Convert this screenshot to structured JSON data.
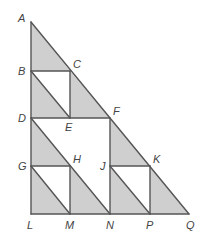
{
  "diagram": {
    "colors": {
      "shade": "#cfcfcf",
      "line": "#555555",
      "label": "#444444",
      "background": "#ffffff"
    },
    "points": {
      "A": [
        31,
        22
      ],
      "B": [
        31,
        71
      ],
      "C": [
        70,
        71
      ],
      "D": [
        31,
        118
      ],
      "E": [
        70,
        118
      ],
      "F": [
        110,
        118
      ],
      "G": [
        31,
        166
      ],
      "H": [
        70,
        166
      ],
      "J": [
        110,
        166
      ],
      "K": [
        150,
        166
      ],
      "L": [
        31,
        214
      ],
      "M": [
        70,
        214
      ],
      "N": [
        110,
        214
      ],
      "P": [
        150,
        214
      ],
      "Q": [
        189,
        214
      ]
    },
    "shaded_triangles": [
      [
        "A",
        "B",
        "C"
      ],
      [
        "B",
        "D",
        "E"
      ],
      [
        "C",
        "E",
        "F"
      ],
      [
        "D",
        "G",
        "H"
      ],
      [
        "G",
        "L",
        "M"
      ],
      [
        "H",
        "M",
        "N"
      ],
      [
        "F",
        "J",
        "K"
      ],
      [
        "J",
        "N",
        "P"
      ],
      [
        "K",
        "P",
        "Q"
      ]
    ],
    "segments": [
      [
        "A",
        "L"
      ],
      [
        "L",
        "Q"
      ],
      [
        "A",
        "Q"
      ],
      [
        "B",
        "C"
      ],
      [
        "C",
        "E"
      ],
      [
        "B",
        "E"
      ],
      [
        "D",
        "F"
      ],
      [
        "D",
        "N"
      ],
      [
        "G",
        "H"
      ],
      [
        "H",
        "M"
      ],
      [
        "G",
        "M"
      ],
      [
        "F",
        "N"
      ],
      [
        "J",
        "K"
      ],
      [
        "K",
        "P"
      ],
      [
        "J",
        "P"
      ]
    ],
    "labels": [
      {
        "text": "A",
        "x": 18,
        "y": 22
      },
      {
        "text": "B",
        "x": 18,
        "y": 75
      },
      {
        "text": "C",
        "x": 73,
        "y": 68
      },
      {
        "text": "D",
        "x": 18,
        "y": 122
      },
      {
        "text": "E",
        "x": 65,
        "y": 131
      },
      {
        "text": "F",
        "x": 113,
        "y": 115
      },
      {
        "text": "G",
        "x": 18,
        "y": 170
      },
      {
        "text": "H",
        "x": 73,
        "y": 163
      },
      {
        "text": "J",
        "x": 100,
        "y": 170
      },
      {
        "text": "K",
        "x": 153,
        "y": 163
      },
      {
        "text": "L",
        "x": 27,
        "y": 229
      },
      {
        "text": "M",
        "x": 65,
        "y": 229
      },
      {
        "text": "N",
        "x": 106,
        "y": 229
      },
      {
        "text": "P",
        "x": 146,
        "y": 229
      },
      {
        "text": "Q",
        "x": 186,
        "y": 229
      }
    ]
  }
}
